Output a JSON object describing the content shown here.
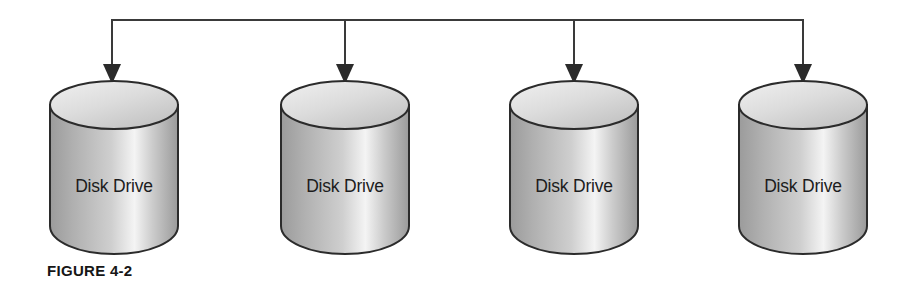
{
  "figure": {
    "caption": "FIGURE 4-2",
    "background_color": "#ffffff",
    "line_color": "#3a3a3a",
    "outline_color": "#2b2b2b",
    "label_color": "#1c1c1c",
    "cylinder_top_color": "#d9d9d9",
    "cylinder_body_light": "#f2f2f2",
    "cylinder_body_dark": "#9b9b9b"
  },
  "bus": {
    "name": "connection-bus",
    "orientation": "horizontal",
    "y": 20,
    "x_start": 112,
    "x_end": 803,
    "drop_x": [
      112,
      345,
      574,
      803
    ],
    "arrow_tip_y": 84
  },
  "drives": [
    {
      "label": "Disk Drive",
      "x": 48,
      "y": 80
    },
    {
      "label": "Disk Drive",
      "x": 279,
      "y": 80
    },
    {
      "label": "Disk Drive",
      "x": 508,
      "y": 80
    },
    {
      "label": "Disk Drive",
      "x": 737,
      "y": 80
    }
  ]
}
